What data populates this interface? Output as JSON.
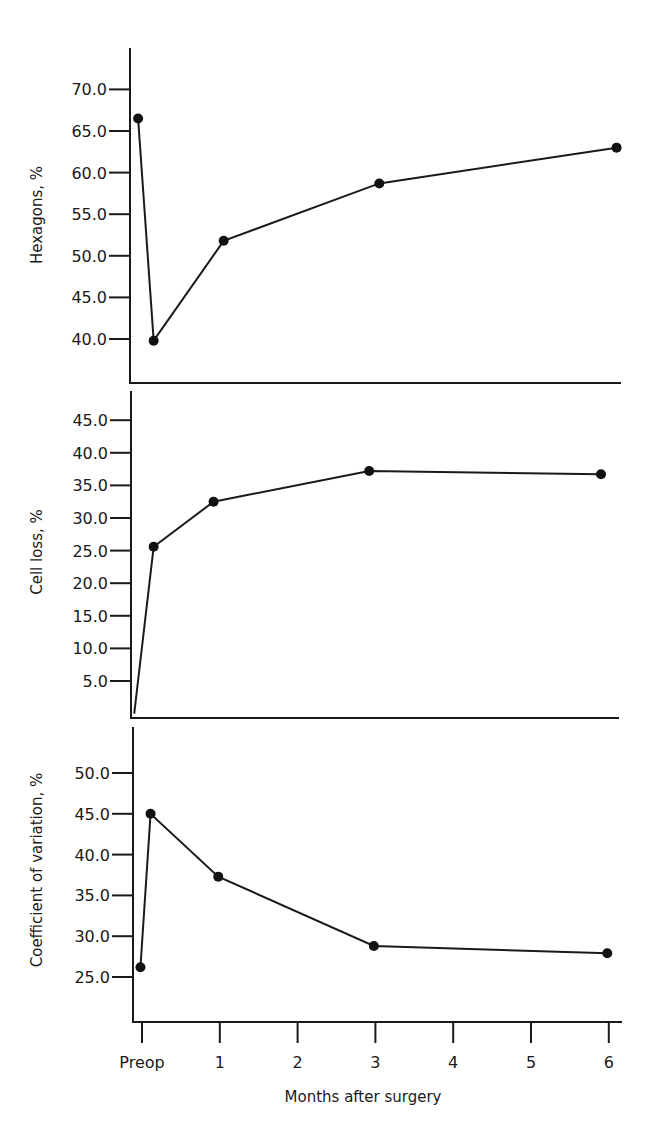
{
  "figure": {
    "xlabel": "Months after surgery",
    "x_tick_labels": [
      "Preop",
      "1",
      "2",
      "3",
      "4",
      "5",
      "6"
    ]
  },
  "chart_data": [
    {
      "type": "line",
      "title": "",
      "xlabel": "Months after surgery",
      "ylabel": "Hexagons, %",
      "x": [
        "Preop",
        "~1 week",
        "1",
        "3",
        "6"
      ],
      "x_numeric": [
        -0.05,
        0.15,
        1.05,
        3.05,
        6.1
      ],
      "values": [
        66.5,
        39.8,
        51.8,
        58.7,
        63.0
      ],
      "y_ticks": [
        40.0,
        45.0,
        50.0,
        55.0,
        60.0,
        65.0,
        70.0
      ],
      "y_tick_labels": [
        "40.0",
        "45.0",
        "50.0",
        "55.0",
        "60.0",
        "65.0",
        "70.0"
      ],
      "ylim": [
        34.8,
        72.5
      ],
      "grid": false,
      "marker": "filled-circle"
    },
    {
      "type": "line",
      "title": "",
      "xlabel": "Months after surgery",
      "ylabel": "Cell loss, %",
      "x": [
        "Preop",
        "~1 week",
        "1",
        "3",
        "6"
      ],
      "x_numeric": [
        -0.1,
        0.15,
        0.92,
        2.92,
        5.9
      ],
      "values": [
        0.0,
        25.6,
        32.5,
        37.2,
        36.7
      ],
      "y_ticks": [
        5.0,
        10.0,
        15.0,
        20.0,
        25.0,
        30.0,
        35.0,
        40.0,
        45.0
      ],
      "y_tick_labels": [
        "5.0",
        "10.0",
        "15.0",
        "20.0",
        "25.0",
        "30.0",
        "35.0",
        "40.0",
        "45.0"
      ],
      "ylim": [
        0,
        49.5
      ],
      "grid": false,
      "marker": "filled-circle"
    },
    {
      "type": "line",
      "title": "",
      "xlabel": "Months after surgery",
      "ylabel": "Coefficient of variation, %",
      "x": [
        "Preop",
        "~1 week",
        "1",
        "3",
        "6"
      ],
      "x_numeric": [
        -0.02,
        0.11,
        0.98,
        2.98,
        5.98
      ],
      "values": [
        26.2,
        45.0,
        37.3,
        28.8,
        27.9
      ],
      "y_ticks": [
        25.0,
        30.0,
        35.0,
        40.0,
        45.0,
        50.0
      ],
      "y_tick_labels": [
        "25.0",
        "30.0",
        "35.0",
        "40.0",
        "45.0",
        "50.0"
      ],
      "ylim": [
        19.5,
        55.6
      ],
      "grid": false,
      "marker": "filled-circle"
    }
  ],
  "layout": {
    "x_axis": {
      "x0": 142,
      "x_per_month": 77.8
    },
    "panels": [
      {
        "axis_x": 130,
        "top": 48,
        "bottom": 383,
        "right": 621,
        "y_of_first_tick": 339,
        "y_step": 41.6
      },
      {
        "axis_x": 131,
        "top": 391,
        "bottom": 718,
        "right": 619,
        "y_of_first_tick": 681,
        "y_step": 32.6
      },
      {
        "axis_x": 133,
        "top": 727,
        "bottom": 1022,
        "right": 622,
        "y_of_first_tick": 977,
        "y_step": 40.8
      }
    ],
    "ylabel_centers": [
      {
        "x": 42,
        "y": 215
      },
      {
        "x": 42,
        "y": 552
      },
      {
        "x": 42,
        "y": 870
      }
    ]
  }
}
